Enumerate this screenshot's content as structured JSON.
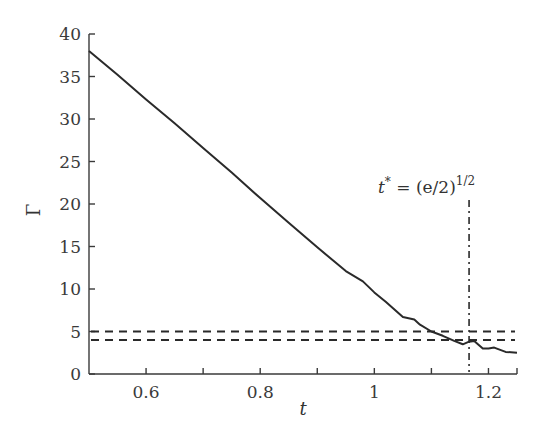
{
  "chart_data": {
    "type": "line",
    "title": "",
    "xlabel": "t",
    "ylabel": "Γ",
    "xlim": [
      0.5,
      1.25
    ],
    "ylim": [
      0,
      40
    ],
    "grid": false,
    "legend": null,
    "x_ticks": [
      0.6,
      0.8,
      1,
      1.2
    ],
    "x_tick_labels": [
      "0.6",
      "0.8",
      "1",
      "1.2"
    ],
    "x_minor_ticks": [
      0.7,
      0.9,
      1.1
    ],
    "y_ticks": [
      0,
      5,
      10,
      15,
      20,
      25,
      30,
      35,
      40
    ],
    "y_tick_labels": [
      "0",
      "5",
      "10",
      "15",
      "20",
      "25",
      "30",
      "35",
      "40"
    ],
    "series": [
      {
        "name": "Γ(t)",
        "style": "solid",
        "color": "#2a2a2a",
        "x": [
          0.5,
          0.55,
          0.6,
          0.65,
          0.7,
          0.75,
          0.8,
          0.85,
          0.9,
          0.95,
          0.98,
          1.0,
          1.02,
          1.05,
          1.07,
          1.08,
          1.1,
          1.12,
          1.14,
          1.155,
          1.166,
          1.175,
          1.19,
          1.2,
          1.21,
          1.23,
          1.25
        ],
        "y": [
          38.0,
          35.2,
          32.3,
          29.5,
          26.6,
          23.7,
          20.7,
          17.8,
          14.9,
          12.1,
          10.9,
          9.6,
          8.5,
          6.7,
          6.4,
          5.8,
          5.0,
          4.5,
          3.9,
          3.5,
          3.8,
          3.9,
          3.0,
          3.0,
          3.1,
          2.6,
          2.5
        ]
      }
    ],
    "reference_lines": [
      {
        "orientation": "horizontal",
        "value": 5,
        "style": "dashed",
        "color": "#2a2a2a"
      },
      {
        "orientation": "horizontal",
        "value": 4,
        "style": "dashed",
        "color": "#2a2a2a"
      },
      {
        "orientation": "vertical",
        "value": 1.166,
        "style": "dash-dot",
        "color": "#2a2a2a",
        "label": "t* = (e/2)^1/2"
      }
    ],
    "annotations": [
      {
        "text_main": "t",
        "text_sup1": "*",
        "text_eq": " = (e/2)",
        "text_sup2": "1/2",
        "x": 1.166,
        "y": 41
      }
    ]
  }
}
